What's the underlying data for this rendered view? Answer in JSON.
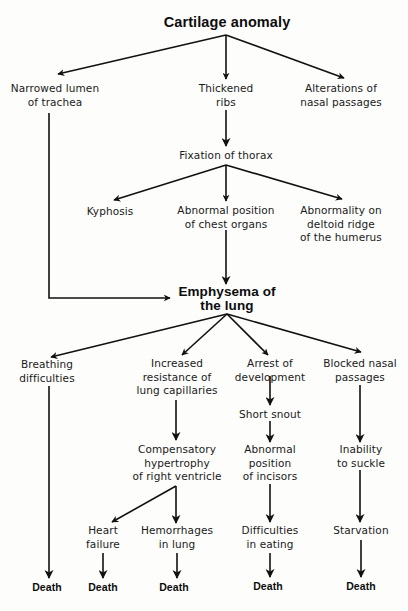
{
  "diagram": {
    "type": "flowchart",
    "direction": "top-to-bottom",
    "colors": {
      "background": "#fdfdfc",
      "text": "#1a1a1a",
      "arrows": "#111111"
    },
    "nodes": {
      "cartilage": {
        "lines": [
          "Cartilage anomaly"
        ]
      },
      "trachea": {
        "lines": [
          "Narrowed lumen",
          "of trachea"
        ]
      },
      "ribs": {
        "lines": [
          "Thickened",
          "ribs"
        ]
      },
      "nasal_alt": {
        "lines": [
          "Alterations of",
          "nasal passages"
        ]
      },
      "thorax": {
        "lines": [
          "Fixation of thorax"
        ]
      },
      "kyphosis": {
        "lines": [
          "Kyphosis"
        ]
      },
      "chest": {
        "lines": [
          "Abnormal position",
          "of chest organs"
        ]
      },
      "deltoid": {
        "lines": [
          "Abnormality on",
          "deltoid ridge",
          "of the humerus"
        ]
      },
      "emphysema": {
        "lines": [
          "Emphysema of",
          "the lung"
        ]
      },
      "breathing": {
        "lines": [
          "Breathing",
          "difficulties"
        ]
      },
      "resistance": {
        "lines": [
          "Increased",
          "resistance of",
          "lung capillaries"
        ]
      },
      "arrest": {
        "lines": [
          "Arrest of",
          "development"
        ]
      },
      "blocked": {
        "lines": [
          "Blocked nasal",
          "passages"
        ]
      },
      "snout": {
        "lines": [
          "Short snout"
        ]
      },
      "hypertrophy": {
        "lines": [
          "Compensatory",
          "hypertrophy",
          "of right ventricle"
        ]
      },
      "incisors": {
        "lines": [
          "Abnormal",
          "position",
          "of incisors"
        ]
      },
      "suckle": {
        "lines": [
          "Inability",
          "to suckle"
        ]
      },
      "heart": {
        "lines": [
          "Heart",
          "failure"
        ]
      },
      "hemorrhage": {
        "lines": [
          "Hemorrhages",
          "in lung"
        ]
      },
      "eating": {
        "lines": [
          "Difficulties",
          "in eating"
        ]
      },
      "starvation": {
        "lines": [
          "Starvation"
        ]
      },
      "death1": {
        "lines": [
          "Death"
        ]
      },
      "death2": {
        "lines": [
          "Death"
        ]
      },
      "death3": {
        "lines": [
          "Death"
        ]
      },
      "death4": {
        "lines": [
          "Death"
        ]
      },
      "death5": {
        "lines": [
          "Death"
        ]
      }
    },
    "edges": [
      [
        "cartilage",
        "trachea"
      ],
      [
        "cartilage",
        "ribs"
      ],
      [
        "cartilage",
        "nasal_alt"
      ],
      [
        "ribs",
        "thorax"
      ],
      [
        "thorax",
        "kyphosis"
      ],
      [
        "thorax",
        "chest"
      ],
      [
        "thorax",
        "deltoid"
      ],
      [
        "trachea",
        "emphysema"
      ],
      [
        "chest",
        "emphysema"
      ],
      [
        "emphysema",
        "breathing"
      ],
      [
        "emphysema",
        "resistance"
      ],
      [
        "emphysema",
        "arrest"
      ],
      [
        "emphysema",
        "blocked"
      ],
      [
        "resistance",
        "hypertrophy"
      ],
      [
        "hypertrophy",
        "heart"
      ],
      [
        "hypertrophy",
        "hemorrhage"
      ],
      [
        "arrest",
        "snout"
      ],
      [
        "snout",
        "incisors"
      ],
      [
        "incisors",
        "eating"
      ],
      [
        "blocked",
        "suckle"
      ],
      [
        "suckle",
        "starvation"
      ],
      [
        "breathing",
        "death1"
      ],
      [
        "heart",
        "death2"
      ],
      [
        "hemorrhage",
        "death3"
      ],
      [
        "eating",
        "death4"
      ],
      [
        "starvation",
        "death5"
      ]
    ]
  }
}
